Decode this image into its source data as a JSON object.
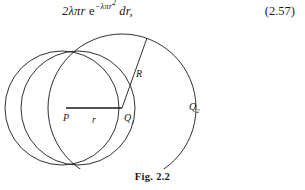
{
  "equation": {
    "coefficient": "2",
    "lambda_symbol": "λ",
    "pi_symbol": "π",
    "radius_var": "r",
    "exp_base": "e",
    "exp_minus": "−",
    "exp_lambda": "λ",
    "exp_pi": "π",
    "exp_r": "r",
    "exp_power": "2",
    "differential": "dr,",
    "number": "(2.57)"
  },
  "figure": {
    "caption": "Fig. 2.2",
    "labels": {
      "center_p": "P",
      "radius_r": "r",
      "point_q1": "Q",
      "point_q1_sub": "1",
      "radius_big": "R",
      "point_q2": "Q",
      "point_q2_sub": "2"
    },
    "geometry": {
      "stroke_color": "#1a1a1a",
      "stroke_width": 0.9,
      "circle_left": {
        "cx": 62,
        "cy": 84,
        "r": 57
      },
      "circle_middle": {
        "cx": 66,
        "cy": 84,
        "r": 57
      },
      "circle_big": {
        "cx": 122,
        "cy": 84,
        "r": 74
      },
      "segment_r": {
        "x1": 66,
        "y1": 84,
        "x2": 122,
        "y2": 84
      },
      "segment_R": {
        "x1": 122,
        "y1": 84,
        "x2": 147,
        "y2": 14
      }
    }
  }
}
